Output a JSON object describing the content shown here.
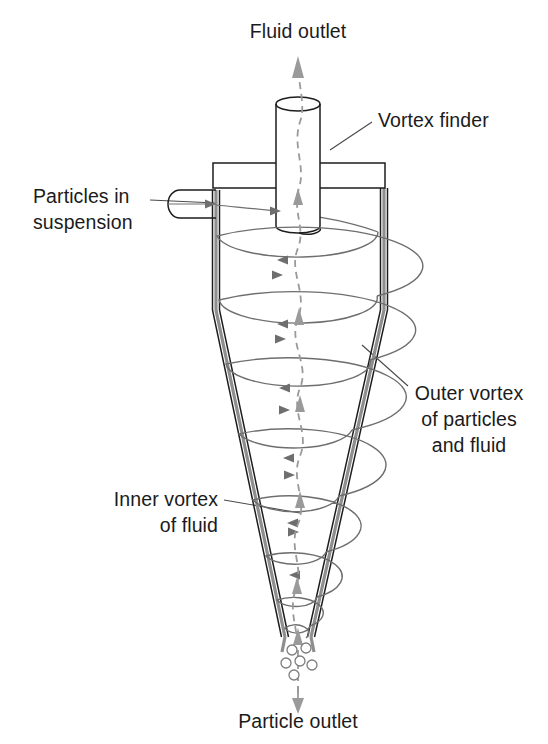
{
  "figure": {
    "background_color": "#ffffff",
    "line_color": "#1d1d1d",
    "wall_shade_color": "#8e8e8e",
    "flow_color": "#6e6e6e",
    "inner_vortex_color": "#9a9a9a",
    "text_color": "#1b1b1b"
  },
  "labels": {
    "fluid_outlet": "Fluid outlet",
    "vortex_finder": "Vortex finder",
    "particles_in_suspension_line1": "Particles in",
    "particles_in_suspension_line2": "suspension",
    "outer_vortex_line1": "Outer vortex",
    "outer_vortex_line2": "of particles",
    "outer_vortex_line3": "and fluid",
    "inner_vortex_line1": "Inner vortex",
    "inner_vortex_line2": "of fluid",
    "particle_outlet": "Particle outlet"
  },
  "geometry": {
    "body_top_y": 188,
    "cylinder_bottom_y": 310,
    "apex_y": 637,
    "body_left_x": 216,
    "body_right_x": 384,
    "apex_left_x": 281,
    "apex_right_x": 311,
    "top_plate": {
      "x": 213,
      "y": 163,
      "width": 172,
      "height": 25
    },
    "vortex_finder": {
      "cx": 298,
      "top_y": 97,
      "bottom_y": 233,
      "rx": 22,
      "ry": 7
    },
    "inlet_pipe": {
      "left_x": 168,
      "right_x": 216,
      "top_y": 190,
      "bottom_y": 218
    }
  },
  "spiral_turns": [
    {
      "cy": 236,
      "rx": 81,
      "ry": 25
    },
    {
      "cy": 300,
      "rx": 79,
      "ry": 25
    },
    {
      "cy": 364,
      "rx": 72,
      "ry": 24
    },
    {
      "cy": 434,
      "rx": 59,
      "ry": 22
    },
    {
      "cy": 500,
      "rx": 45,
      "ry": 19
    },
    {
      "cy": 556,
      "rx": 32,
      "ry": 15
    },
    {
      "cy": 600,
      "rx": 21,
      "ry": 11
    },
    {
      "cy": 628,
      "rx": 13,
      "ry": 8
    }
  ],
  "particles": [
    {
      "cx": 292,
      "cy": 650,
      "r": 5
    },
    {
      "cx": 306,
      "cy": 648,
      "r": 5
    },
    {
      "cx": 286,
      "cy": 663,
      "r": 5
    },
    {
      "cx": 300,
      "cy": 661,
      "r": 5
    },
    {
      "cx": 312,
      "cy": 665,
      "r": 5
    },
    {
      "cx": 294,
      "cy": 675,
      "r": 5
    }
  ]
}
